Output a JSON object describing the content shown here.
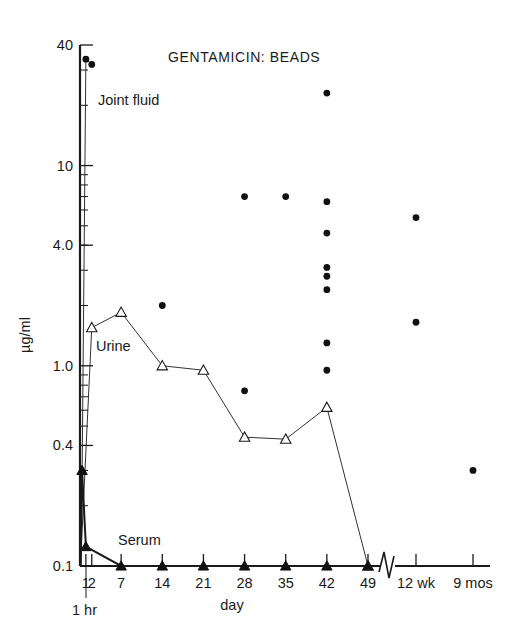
{
  "figure": {
    "title": "GENTAMICIN: BEADS",
    "y_axis_title": "µg/ml",
    "x_axis_title": "day",
    "hour_annotation": "1 hr"
  },
  "series_labels": {
    "joint_fluid": "Joint fluid",
    "urine": "Urine",
    "serum": "Serum"
  },
  "chart_data": {
    "type": "scatter",
    "title": "GENTAMICIN: BEADS",
    "xlabel": "day",
    "ylabel": "µg/ml",
    "yscale": "log",
    "ylim": [
      0.1,
      40
    ],
    "ytick_labels": [
      "40",
      "10",
      "4.0",
      "1.0",
      "0.4",
      "0.1"
    ],
    "ytick_values": [
      40,
      10,
      4.0,
      1.0,
      0.4,
      0.1
    ],
    "xtick_labels": [
      "1",
      "2",
      "7",
      "14",
      "21",
      "28",
      "35",
      "42",
      "49",
      "12 wk",
      "9 mos"
    ],
    "xtick_values": [
      1,
      2,
      7,
      14,
      21,
      28,
      35,
      42,
      49,
      84,
      270
    ],
    "axis_break_after": 49,
    "grid": false,
    "legend": "inline-labels",
    "annotations": [
      {
        "text": "1 hr",
        "x": 0.04,
        "note": "tick just left of day 1 marking one hour post-dose"
      },
      {
        "text": "Joint fluid",
        "x": 2,
        "y": 20
      },
      {
        "text": "Urine",
        "x": 3,
        "y": 1.55
      },
      {
        "text": "Serum",
        "x": 9,
        "y": 0.19
      }
    ],
    "series": [
      {
        "name": "Joint fluid",
        "marker": "filled-circle",
        "connected_points": [
          {
            "x": 1,
            "y": 34
          },
          {
            "x": 2,
            "y": 32
          }
        ],
        "scatter_points": [
          {
            "x": 14,
            "y": 2.0
          },
          {
            "x": 28,
            "y": 7.0
          },
          {
            "x": 28,
            "y": 0.75
          },
          {
            "x": 35,
            "y": 7.0
          },
          {
            "x": 42,
            "y": 23
          },
          {
            "x": 42,
            "y": 6.6
          },
          {
            "x": 42,
            "y": 4.6
          },
          {
            "x": 42,
            "y": 3.1
          },
          {
            "x": 42,
            "y": 2.8
          },
          {
            "x": 42,
            "y": 2.4
          },
          {
            "x": 42,
            "y": 1.3
          },
          {
            "x": 42,
            "y": 0.95
          },
          {
            "x": 84,
            "y": 5.5
          },
          {
            "x": 84,
            "y": 1.65
          },
          {
            "x": 270,
            "y": 0.3
          }
        ]
      },
      {
        "name": "Urine",
        "marker": "open-triangle",
        "connected_points": [
          {
            "x": 0.08,
            "y": 0.1
          },
          {
            "x": 2,
            "y": 1.55
          },
          {
            "x": 7,
            "y": 1.85
          },
          {
            "x": 14,
            "y": 1.0
          },
          {
            "x": 21,
            "y": 0.95
          },
          {
            "x": 28,
            "y": 0.44
          },
          {
            "x": 35,
            "y": 0.43
          },
          {
            "x": 42,
            "y": 0.62
          },
          {
            "x": 49,
            "y": 0.1
          }
        ]
      },
      {
        "name": "Serum",
        "marker": "filled-triangle",
        "connected_points": [
          {
            "x": 0.04,
            "y": 0.1
          },
          {
            "x": 0.35,
            "y": 0.3
          },
          {
            "x": 1,
            "y": 0.125
          },
          {
            "x": 7,
            "y": 0.1
          },
          {
            "x": 14,
            "y": 0.1
          },
          {
            "x": 21,
            "y": 0.1
          },
          {
            "x": 28,
            "y": 0.1
          },
          {
            "x": 35,
            "y": 0.1
          },
          {
            "x": 42,
            "y": 0.1
          },
          {
            "x": 49,
            "y": 0.1
          }
        ]
      }
    ]
  }
}
